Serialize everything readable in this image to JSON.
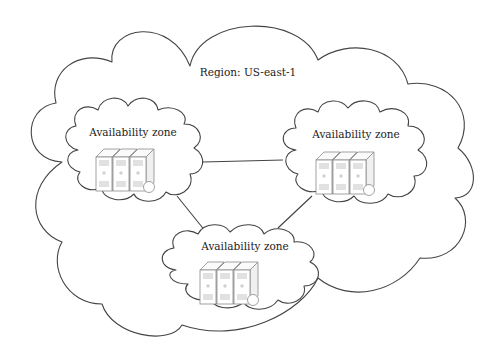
{
  "region": {
    "label": "Region: US-east-1"
  },
  "zones": [
    {
      "id": "az-left",
      "label": "Availability zone",
      "servers": 3
    },
    {
      "id": "az-right",
      "label": "Availability zone",
      "servers": 3
    },
    {
      "id": "az-bottom",
      "label": "Availability zone",
      "servers": 3
    }
  ],
  "links": [
    {
      "from": "az-left",
      "to": "az-right"
    },
    {
      "from": "az-left",
      "to": "az-bottom"
    },
    {
      "from": "az-right",
      "to": "az-bottom"
    }
  ],
  "colors": {
    "outline": "#444444",
    "server_outline": "#8a8a8a",
    "background": "#ffffff",
    "text": "#222222"
  }
}
